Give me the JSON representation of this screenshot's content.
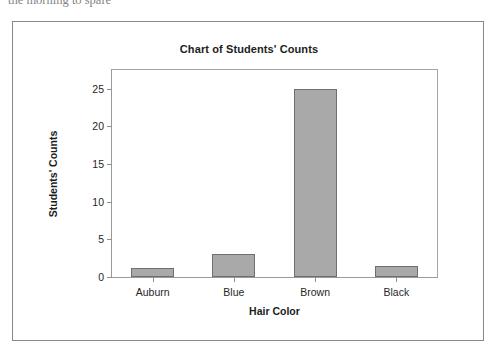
{
  "page": {
    "top_text_fragment": "the morning to spare"
  },
  "chart_data": {
    "type": "bar",
    "title": "Chart of Students' Counts",
    "xlabel": "Hair Color",
    "ylabel": "Students' Counts",
    "categories": [
      "Auburn",
      "Blue",
      "Brown",
      "Black"
    ],
    "values": [
      1.2,
      3,
      25,
      1.5
    ],
    "ylim": [
      0,
      27.5
    ],
    "yticks": [
      0,
      5,
      10,
      15,
      20,
      25
    ],
    "ytick_labels": [
      "0",
      "5",
      "10",
      "15",
      "20",
      "25"
    ],
    "grid": false,
    "legend": false,
    "bar_color": "#a9a9a9",
    "bar_border_color": "#6f6f6f",
    "axis_color": "#9a9a9a",
    "plot_background": "#ffffff",
    "frame_border_color": "#8a8a8a"
  }
}
